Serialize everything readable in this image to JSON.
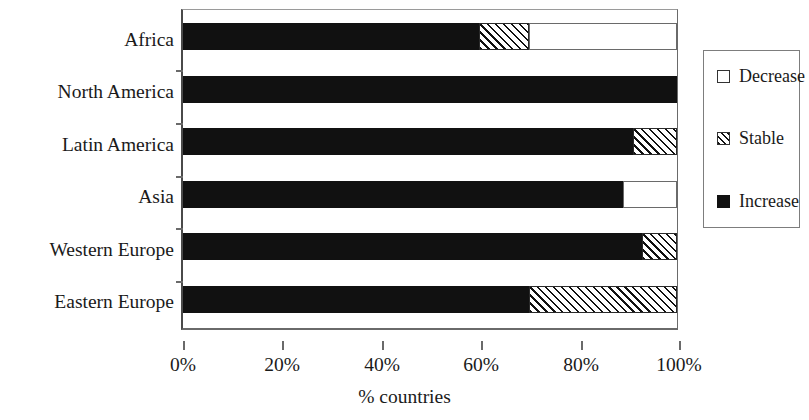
{
  "chart_data": {
    "type": "bar",
    "orientation": "horizontal",
    "stacked": true,
    "title": "",
    "xlabel": "% countries",
    "ylabel": "",
    "xlim": [
      0,
      100
    ],
    "xticks": [
      "0%",
      "20%",
      "40%",
      "60%",
      "80%",
      "100%"
    ],
    "xtick_values": [
      0,
      20,
      40,
      60,
      80,
      100
    ],
    "grid": false,
    "legend_position": "right",
    "categories": [
      "Africa",
      "North America",
      "Latin America",
      "Asia",
      "Western Europe",
      "Eastern Europe"
    ],
    "series": [
      {
        "name": "Increase",
        "fill": "solid-black",
        "color": "#111111",
        "values": [
          60,
          100,
          91,
          89,
          93,
          70
        ]
      },
      {
        "name": "Stable",
        "fill": "diagonal-hatch",
        "color": "#ffffff",
        "values": [
          10,
          0,
          9,
          0,
          7,
          30
        ]
      },
      {
        "name": "Decrease",
        "fill": "white",
        "color": "#ffffff",
        "values": [
          30,
          0,
          0,
          11,
          0,
          0
        ]
      }
    ]
  },
  "legend": {
    "items": [
      {
        "label": "Decrease",
        "swatch": "white-square-icon"
      },
      {
        "label": "Stable",
        "swatch": "hatched-square-icon"
      },
      {
        "label": "Increase",
        "swatch": "black-square-icon"
      }
    ]
  },
  "axis": {
    "x_title": "% countries"
  }
}
